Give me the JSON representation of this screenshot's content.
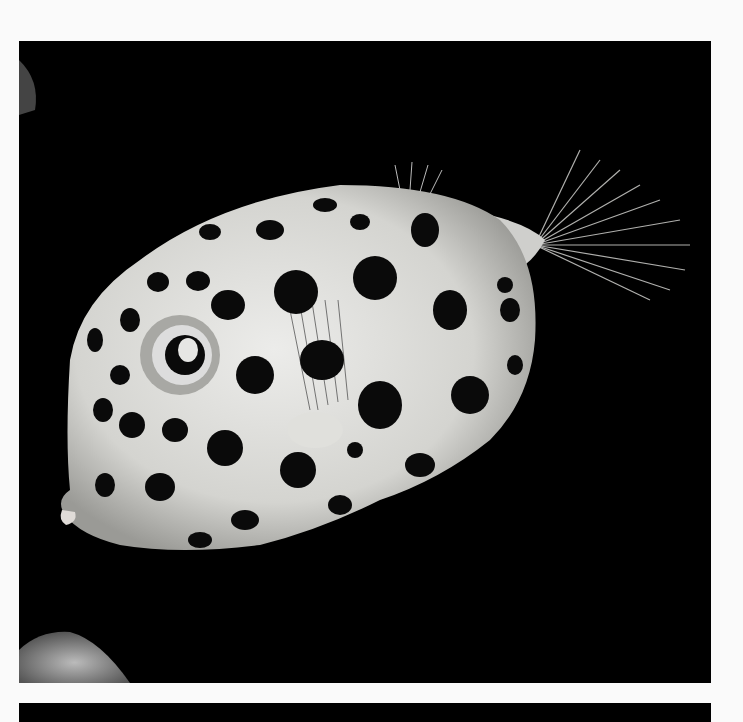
{
  "image": {
    "subject": "spotted boxfish",
    "background_color": "#000000",
    "page_color": "#fafafa",
    "fish_body_color": "#d9d9d6",
    "spot_color": "#0a0a0a",
    "spots": [
      [
        425,
        230,
        14,
        17
      ],
      [
        375,
        278,
        22,
        22
      ],
      [
        296,
        292,
        22,
        22
      ],
      [
        228,
        305,
        17,
        15
      ],
      [
        198,
        281,
        12,
        10
      ],
      [
        158,
        282,
        11,
        10
      ],
      [
        130,
        320,
        10,
        12
      ],
      [
        95,
        340,
        8,
        12
      ],
      [
        120,
        375,
        10,
        10
      ],
      [
        103,
        410,
        10,
        12
      ],
      [
        132,
        425,
        13,
        13
      ],
      [
        175,
        430,
        13,
        12
      ],
      [
        255,
        375,
        19,
        19
      ],
      [
        322,
        360,
        22,
        20
      ],
      [
        380,
        405,
        22,
        24
      ],
      [
        450,
        310,
        17,
        20
      ],
      [
        470,
        395,
        19,
        19
      ],
      [
        510,
        310,
        10,
        12
      ],
      [
        515,
        365,
        8,
        10
      ],
      [
        225,
        448,
        18,
        18
      ],
      [
        160,
        487,
        15,
        14
      ],
      [
        105,
        485,
        10,
        12
      ],
      [
        298,
        470,
        18,
        18
      ],
      [
        245,
        520,
        14,
        10
      ],
      [
        200,
        540,
        12,
        8
      ],
      [
        340,
        505,
        12,
        10
      ],
      [
        420,
        465,
        15,
        12
      ],
      [
        270,
        230,
        14,
        10
      ],
      [
        325,
        205,
        12,
        7
      ],
      [
        210,
        232,
        11,
        8
      ],
      [
        360,
        222,
        10,
        8
      ],
      [
        505,
        285,
        8,
        8
      ],
      [
        170,
        350,
        10,
        10
      ],
      [
        355,
        450,
        8,
        8
      ]
    ]
  }
}
